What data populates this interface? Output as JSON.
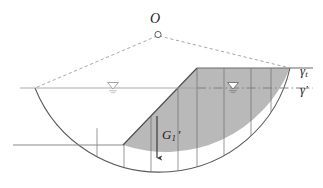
{
  "figure": {
    "labels": {
      "center": "O",
      "slice_weight": "G",
      "slice_weight_sub": "1",
      "slice_weight_prime": "'",
      "gamma_total": "γ",
      "gamma_total_sub": "t",
      "gamma_effective": "γ'"
    },
    "icons": {
      "center_point": "circle-marker-icon",
      "water_table_left": "water-table-icon",
      "water_table_right": "water-table-icon",
      "weight_arrow": "down-arrow-icon"
    },
    "colors": {
      "fill_gray": "#b3b3b3",
      "outline": "#4d4d4d",
      "dashed": "#9a9a9a",
      "ground_line": "#8a8a8a",
      "water_line": "#9a9a9a",
      "text": "#1d1d1d"
    },
    "geometry": {
      "center": [
        157,
        34
      ],
      "slip_entry": [
        35,
        88
      ],
      "slip_exit": [
        290,
        68
      ],
      "radius": 134,
      "crest": [
        197,
        68
      ],
      "toe": [
        123,
        145
      ],
      "ground_upper_y": 68,
      "ground_lower_y": 145,
      "water_table_y": 88,
      "slice_boundaries_x": [
        97,
        124,
        151,
        178,
        197,
        224,
        251,
        271
      ],
      "water_marker_left_x": 113,
      "water_marker_right_x": 233
    }
  }
}
